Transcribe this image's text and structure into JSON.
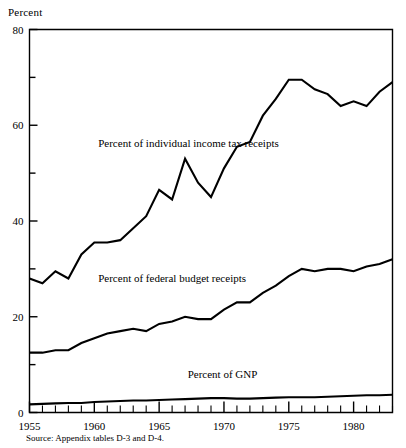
{
  "figure": {
    "y_axis_title": "Percent",
    "source_note": "Source: Appendix tables D-3 and D-4."
  },
  "chart_data": {
    "type": "line",
    "title": "",
    "xlabel": "",
    "ylabel": "Percent",
    "xlim": [
      1955,
      1983
    ],
    "ylim": [
      0,
      80
    ],
    "grid": false,
    "legend_position": "inline-annotations",
    "y_ticks_major": [
      0,
      20,
      40,
      60,
      80
    ],
    "y_ticks_minor": [
      10,
      30,
      50,
      70
    ],
    "x_ticks_labeled": [
      1955,
      1960,
      1965,
      1970,
      1975,
      1980
    ],
    "x_ticks_all": [
      1955,
      1956,
      1957,
      1958,
      1959,
      1960,
      1961,
      1962,
      1963,
      1964,
      1965,
      1966,
      1967,
      1968,
      1969,
      1970,
      1971,
      1972,
      1973,
      1974,
      1975,
      1976,
      1977,
      1978,
      1979,
      1980,
      1981,
      1982,
      1983
    ],
    "x": [
      1955,
      1956,
      1957,
      1958,
      1959,
      1960,
      1961,
      1962,
      1963,
      1964,
      1965,
      1966,
      1967,
      1968,
      1969,
      1970,
      1971,
      1972,
      1973,
      1974,
      1975,
      1976,
      1977,
      1978,
      1979,
      1980,
      1981,
      1982,
      1983
    ],
    "series": [
      {
        "name": "Percent of individual income tax receipts",
        "label": "Percent of individual income tax receipts",
        "values": [
          28.0,
          27.0,
          29.5,
          28.0,
          33.0,
          35.5,
          35.5,
          36.0,
          38.5,
          41.0,
          46.5,
          44.5,
          53.0,
          48.0,
          45.0,
          51.0,
          55.5,
          56.5,
          62.0,
          65.5,
          69.5,
          69.5,
          67.5,
          66.5,
          64.0,
          65.0,
          64.0,
          67.0,
          69.0
        ]
      },
      {
        "name": "Percent of federal budget receipts",
        "label": "Percent of federal budget receipts",
        "values": [
          12.5,
          12.5,
          13.0,
          13.0,
          14.5,
          15.5,
          16.5,
          17.0,
          17.5,
          17.0,
          18.5,
          19.0,
          20.0,
          19.5,
          19.5,
          21.5,
          23.0,
          23.0,
          25.0,
          26.5,
          28.5,
          30.0,
          29.5,
          30.0,
          30.0,
          29.5,
          30.5,
          31.0,
          32.0
        ]
      },
      {
        "name": "Percent of GNP",
        "label": "Percent of GNP",
        "values": [
          1.7,
          1.8,
          1.9,
          2.0,
          2.0,
          2.2,
          2.3,
          2.4,
          2.5,
          2.5,
          2.6,
          2.7,
          2.8,
          2.9,
          3.0,
          3.0,
          2.9,
          2.9,
          3.0,
          3.1,
          3.2,
          3.2,
          3.2,
          3.3,
          3.4,
          3.5,
          3.6,
          3.6,
          3.7
        ]
      }
    ],
    "annotations": [
      {
        "text": "Percent of individual income tax receipts",
        "x": 1960.3,
        "y": 55.5
      },
      {
        "text": "Percent of federal budget receipts",
        "x": 1960.3,
        "y": 27.3
      },
      {
        "text": "Percent of GNP",
        "x": 1967.2,
        "y": 7.2
      }
    ]
  }
}
